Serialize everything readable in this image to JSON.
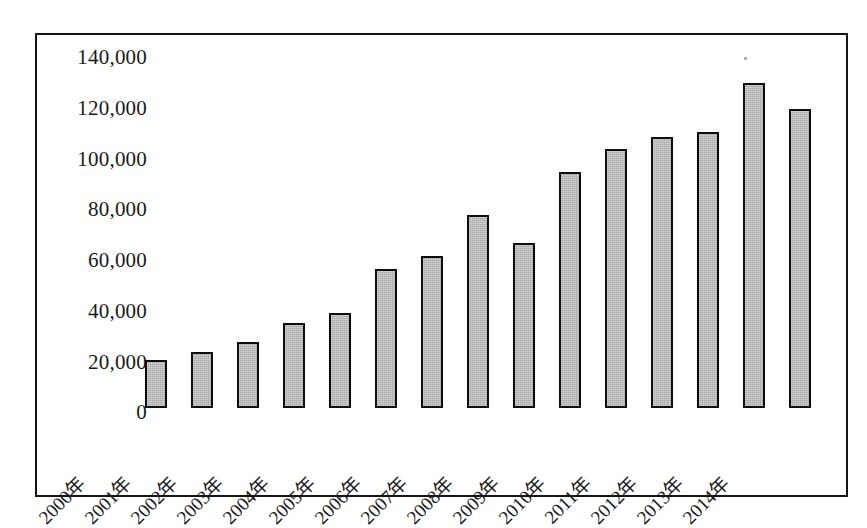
{
  "chart_data": {
    "type": "bar",
    "title": "",
    "subtitle": "",
    "xlabel": "",
    "ylabel": "",
    "categories": [
      "2000年",
      "2001年",
      "2002年",
      "2003年",
      "2004年",
      "2005年",
      "2006年",
      "2007年",
      "2008年",
      "2009年",
      "2010年",
      "2011年",
      "2012年",
      "2013年",
      "2014年"
    ],
    "values": [
      19000,
      22000,
      26000,
      33500,
      37500,
      55000,
      60000,
      76000,
      65000,
      93000,
      102000,
      107000,
      109000,
      128000,
      118000
    ],
    "ylim": [
      0,
      140000
    ],
    "ytick_values": [
      0,
      20000,
      40000,
      60000,
      80000,
      100000,
      120000,
      140000
    ],
    "ytick_labels": [
      "0",
      "20,000",
      "40,000",
      "60,000",
      "80,000",
      "100,000",
      "120,000",
      "140,000"
    ],
    "grid": false,
    "legend": false,
    "legend_position": "none",
    "bar_fill_color": "#a8a8a8",
    "bar_border_color": "#0d0d0d",
    "frame_color": "#141414",
    "background_color": "#ffffff",
    "xtick_rotation": -45
  }
}
